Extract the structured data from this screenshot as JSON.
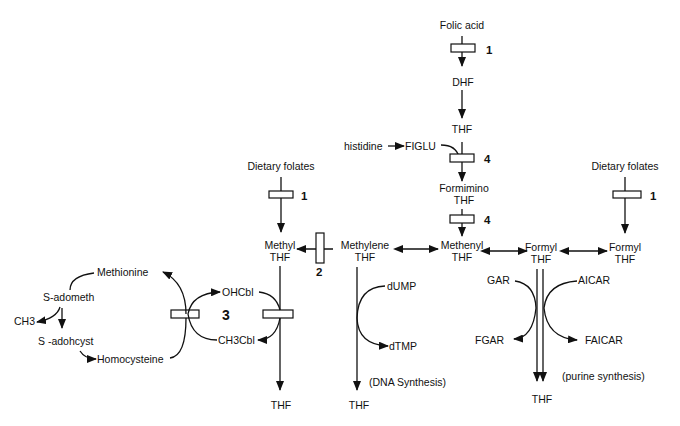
{
  "diagram": {
    "nodes": {
      "folic_acid": "Folic acid",
      "dhf": "DHF",
      "thf_top": "THF",
      "histidine": "histidine",
      "figlu": "FIGLU",
      "formimino_1": "Formimino",
      "formimino_2": "THF",
      "dietary_left": "Dietary folates",
      "dietary_right": "Dietary folates",
      "methyl_1": "Methyl",
      "methyl_2": "THF",
      "methylene_1": "Methylene",
      "methylene_2": "THF",
      "methenyl_1": "Methenyl",
      "methenyl_2": "THF",
      "formyl_mid_1": "Formyl",
      "formyl_mid_2": "THF",
      "formyl_right_1": "Formyl",
      "formyl_right_2": "THF",
      "methionine": "Methionine",
      "s_adometh": "S-adometh",
      "ch3": "CH3",
      "s_adohcyst": "S -adohcyst",
      "homocysteine": "Homocysteine",
      "ohcbl": "OHCbl",
      "ch3cbl": "CH3Cbl",
      "dump": "dUMP",
      "dtmp": "dTMP",
      "dna_synthesis": "(DNA Synthesis)",
      "gar": "GAR",
      "fgar": "FGAR",
      "aicar": "AICAR",
      "faicar": "FAICAR",
      "purine_synthesis": "(purine synthesis)",
      "thf_bottom_methyl": "THF",
      "thf_bottom_methylene": "THF",
      "thf_bottom_formyl": "THF"
    },
    "enzyme_labels": {
      "e1_top": "1",
      "e4_a": "4",
      "e4_b": "4",
      "e1_left": "1",
      "e1_right": "1",
      "e2": "2",
      "e3": "3"
    }
  }
}
